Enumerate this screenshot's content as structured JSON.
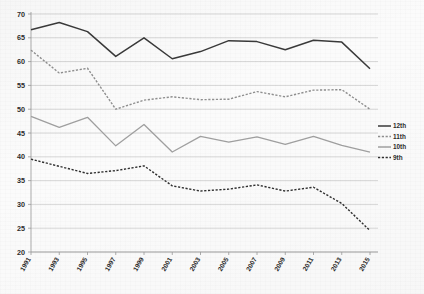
{
  "chart_data": {
    "type": "line",
    "title": "",
    "xlabel": "",
    "ylabel": "",
    "grid": true,
    "legend_position": "right",
    "ylim": [
      20,
      70
    ],
    "ytick_step": 5,
    "yticks": [
      20,
      25,
      30,
      35,
      40,
      45,
      50,
      55,
      60,
      65,
      70
    ],
    "ytick_labels": [
      "20",
      "25",
      "30",
      "35",
      "40",
      "45",
      "50",
      "55",
      "60",
      "65",
      "70"
    ],
    "categories": [
      1991,
      1993,
      1995,
      1997,
      1999,
      2001,
      2003,
      2005,
      2007,
      2009,
      2011,
      2013,
      2015
    ],
    "xtick_labels": [
      "1991",
      "1993",
      "1995",
      "1997",
      "1999",
      "2001",
      "2003",
      "2005",
      "2007",
      "2009",
      "2011",
      "2013",
      "2015"
    ],
    "series": [
      {
        "name": "12th",
        "style": "solid",
        "color": "#3a3a3a",
        "width": 1.5,
        "values": [
          66.7,
          68.2,
          66.3,
          61.1,
          65.0,
          60.6,
          62.1,
          64.4,
          64.2,
          62.5,
          64.5,
          64.1,
          58.5
        ]
      },
      {
        "name": "11th",
        "style": "dashed",
        "color": "#8f8f8f",
        "width": 1.4,
        "values": [
          62.4,
          57.6,
          58.6,
          50.0,
          51.9,
          52.6,
          52.0,
          52.1,
          53.7,
          52.6,
          54.0,
          54.1,
          50.0
        ]
      },
      {
        "name": "10th",
        "style": "solid",
        "color": "#a0a0a0",
        "width": 1.3,
        "values": [
          48.5,
          46.2,
          48.3,
          42.3,
          46.8,
          41.0,
          44.3,
          43.1,
          44.2,
          42.6,
          44.3,
          42.4,
          41.0
        ]
      },
      {
        "name": "9th",
        "style": "dashed",
        "color": "#2f2f2f",
        "width": 1.4,
        "values": [
          39.5,
          38.0,
          36.5,
          37.1,
          38.1,
          33.9,
          32.8,
          33.2,
          34.1,
          32.8,
          33.6,
          30.2,
          24.5
        ]
      }
    ]
  },
  "legend": {
    "entries": [
      {
        "label": "12th",
        "style": "solid",
        "color": "#3a3a3a"
      },
      {
        "label": "11th",
        "style": "dashed",
        "color": "#8f8f8f"
      },
      {
        "label": "10th",
        "style": "solid",
        "color": "#a0a0a0"
      },
      {
        "label": "9th",
        "style": "dashed",
        "color": "#2f2f2f"
      }
    ]
  },
  "colors": {
    "background": "#fbfbfb",
    "grid": "#c9c9c9",
    "axis": "#9a9a9a",
    "text": "#2b2b2b"
  }
}
